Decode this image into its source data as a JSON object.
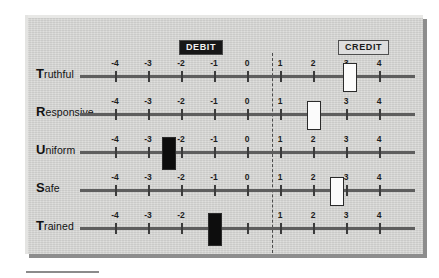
{
  "chart_data": {
    "type": "bar",
    "title": "",
    "subtitle": "",
    "xlabel": "",
    "ylabel": "",
    "grid": false,
    "legend_position": "top",
    "axis": {
      "ticks": [
        -4,
        -3,
        -2,
        -1,
        0,
        1,
        2,
        3,
        4
      ],
      "tick_labels": [
        "-4",
        "-3",
        "-2",
        "-1",
        "0",
        "1",
        "2",
        "3",
        "4"
      ],
      "xlim": [
        -4.7,
        4.7
      ],
      "center_value": 0,
      "center_divider": "dashed"
    },
    "zones": [
      {
        "name": "DEBIT",
        "side": "left",
        "style": "filled-dark"
      },
      {
        "name": "CREDIT",
        "side": "right",
        "style": "outlined-light"
      }
    ],
    "categories": [
      "Truthful",
      "Responsive",
      "Uniform",
      "Safe",
      "Trained"
    ],
    "values": [
      3.1,
      2.0,
      -2.4,
      2.7,
      -1.0
    ],
    "marker_styles": [
      "white",
      "white",
      "black",
      "white",
      "black"
    ],
    "series": [
      {
        "name": "Rating",
        "values": [
          3.1,
          2.0,
          -2.4,
          2.7,
          -1.0
        ]
      }
    ]
  },
  "panel": {
    "badges": {
      "debit": "DEBIT",
      "credit": "CREDIT"
    },
    "rows": [
      {
        "lead": "T",
        "rest": "ruthful",
        "label": "Truthful",
        "value": 3.1,
        "marker": "white",
        "hidden_tick_labels": []
      },
      {
        "lead": "R",
        "rest": "esponsive",
        "label": "Responsive",
        "value": 2.0,
        "marker": "white",
        "hidden_tick_labels": [
          "2"
        ]
      },
      {
        "lead": "U",
        "rest": "niform",
        "label": "Uniform",
        "value": -2.4,
        "marker": "black",
        "hidden_tick_labels": []
      },
      {
        "lead": "S",
        "rest": "afe",
        "label": "Safe",
        "value": 2.7,
        "marker": "white",
        "hidden_tick_labels": []
      },
      {
        "lead": "T",
        "rest": "rained",
        "label": "Trained",
        "value": -1.0,
        "marker": "black",
        "hidden_tick_labels": [
          "-1",
          "0"
        ]
      }
    ]
  },
  "colors": {
    "panel_background": "#d6d6d4",
    "panel_shadow": "#8d8d8d",
    "axis_line": "#5e5e5e",
    "tick": "#3c3c3c",
    "marker_white": "#fbfbfb",
    "marker_black": "#0d0d0d",
    "marker_border": "#2b2b2b",
    "debit_badge_bg": "#171717",
    "debit_badge_text": "#f2f2f2",
    "credit_badge_bg": "#dedede",
    "credit_badge_text": "#1b1b1b",
    "divider": "#4b4b4b",
    "label_text": "#111111"
  },
  "geometry": {
    "axis_left_px": 55,
    "axis_width_px": 335,
    "tick_spacing_px": 33,
    "zero_x_px": 222,
    "row_tops_px": [
      38,
      76,
      114,
      152,
      190
    ]
  }
}
